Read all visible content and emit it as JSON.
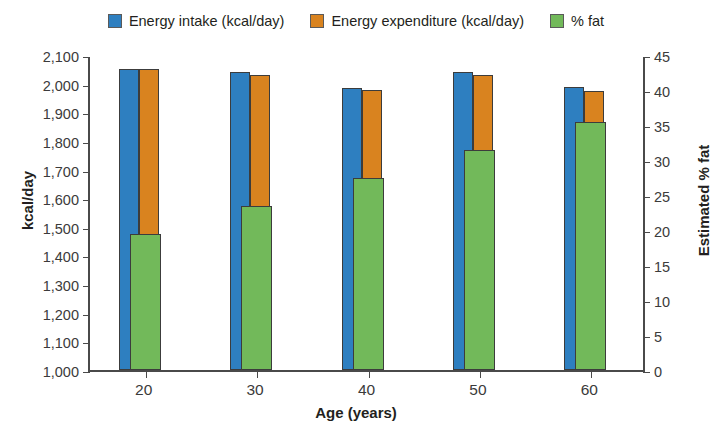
{
  "chart_data": {
    "type": "bar",
    "title": "",
    "subtitle": "",
    "xlabel": "Age (years)",
    "ylabel": "kcal/day",
    "y2label": "Estimated % fat",
    "categories": [
      "20",
      "30",
      "40",
      "50",
      "60"
    ],
    "series": [
      {
        "name": "Energy intake (kcal/day)",
        "axis": "left",
        "color": "#2e7fc0",
        "values": [
          2050,
          2040,
          1985,
          2040,
          1990
        ]
      },
      {
        "name": "Energy expenditure (kcal/day)",
        "axis": "left",
        "color": "#d9831f",
        "values": [
          2050,
          2030,
          1978,
          2030,
          1975
        ]
      },
      {
        "name": "% fat",
        "axis": "right",
        "color": "#72b95a",
        "values": [
          19.5,
          23.5,
          27.5,
          31.5,
          35.5
        ]
      }
    ],
    "ylim": [
      1000,
      2100
    ],
    "y2lim": [
      0,
      45
    ],
    "yticks": [
      "1,000",
      "1,100",
      "1,200",
      "1,300",
      "1,400",
      "1,500",
      "1,600",
      "1,700",
      "1,800",
      "1,900",
      "2,000",
      "2,100"
    ],
    "ytick_values": [
      1000,
      1100,
      1200,
      1300,
      1400,
      1500,
      1600,
      1700,
      1800,
      1900,
      2000,
      2100
    ],
    "y2ticks": [
      "0",
      "5",
      "10",
      "15",
      "20",
      "25",
      "30",
      "35",
      "40",
      "45"
    ],
    "y2tick_values": [
      0,
      5,
      10,
      15,
      20,
      25,
      30,
      35,
      40,
      45
    ],
    "grid": false,
    "legend_position": "top"
  },
  "legend": {
    "items": [
      {
        "label": "Energy intake (kcal/day)",
        "color": "#2e7fc0",
        "icon": "legend-swatch-blue"
      },
      {
        "label": "Energy expenditure (kcal/day)",
        "color": "#d9831f",
        "icon": "legend-swatch-orange"
      },
      {
        "label": "% fat",
        "color": "#72b95a",
        "icon": "legend-swatch-green"
      }
    ]
  },
  "axes": {
    "x_title": "Age (years)",
    "y_left_title": "kcal/day",
    "y_right_title": "Estimated % fat"
  }
}
